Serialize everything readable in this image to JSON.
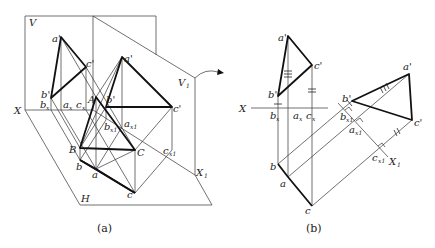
{
  "figure_a": {
    "caption": "(a)",
    "planes": {
      "V": "V",
      "H": "H",
      "V1": "V",
      "V1_sub": "1"
    },
    "axes": {
      "X": "X",
      "X1": "X",
      "X1_sub": "1"
    },
    "labels": {
      "a_prime": "a'",
      "b_prime": "b'",
      "c_prime": "c'",
      "a1_prime": "a'",
      "b1_prime": "b'",
      "c1_prime": "c'",
      "one": "1",
      "bx": "b",
      "ax": "a",
      "cx": "c",
      "x_sub": "x",
      "bx1": "b",
      "ax1": "a",
      "cx1": "c",
      "x1_sub": "x1",
      "A": "A",
      "B": "B",
      "C": "C",
      "a": "a",
      "b": "b",
      "c": "c"
    }
  },
  "figure_b": {
    "caption": "(b)",
    "axes": {
      "X": "X",
      "X1": "X",
      "X1_sub": "1"
    },
    "labels": {
      "a_prime": "a'",
      "b_prime": "b'",
      "c_prime": "c'",
      "a1_prime": "a'",
      "b1_prime": "b'",
      "c1_prime": "c'",
      "one": "1",
      "bx": "b",
      "ax": "a",
      "cx": "c",
      "x_sub": "x",
      "bx1": "b",
      "ax1": "a",
      "cx1": "c",
      "x1_sub": "x1",
      "a": "a",
      "b": "b",
      "c": "c"
    }
  }
}
